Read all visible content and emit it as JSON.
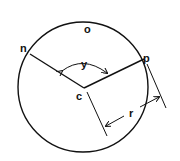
{
  "diagram": {
    "title": "",
    "labels": {
      "o": "o",
      "n": "n",
      "p": "p",
      "c": "c",
      "y": "y",
      "r": "r"
    },
    "elements": [
      {
        "type": "circle",
        "name": "circle-o",
        "center": "c"
      },
      {
        "type": "radius",
        "from": "c",
        "to": "n"
      },
      {
        "type": "radius",
        "from": "c",
        "to": "p"
      },
      {
        "type": "angle",
        "name": "y",
        "between": [
          "cn",
          "cp"
        ]
      },
      {
        "type": "dimension",
        "name": "r",
        "meaning": "radius length"
      }
    ],
    "stroke_color": "#111111"
  }
}
